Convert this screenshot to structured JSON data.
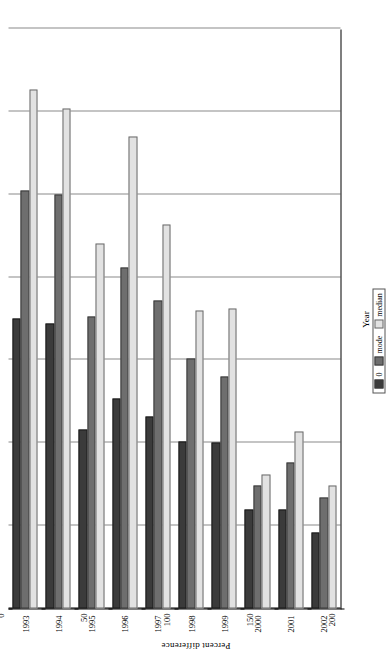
{
  "chart_data": {
    "type": "bar",
    "orientation": "horizontal-rotated",
    "title": "",
    "xlabel": "Year",
    "ylabel": "Percent difference",
    "categories": [
      "1993",
      "1994",
      "1995",
      "1996",
      "1997",
      "1998",
      "1999",
      "2000",
      "2001",
      "2002"
    ],
    "ylim": [
      0,
      350
    ],
    "yticks": [
      0,
      50,
      100,
      150,
      200,
      250,
      300,
      350
    ],
    "ytick_labels": [
      "0",
      "50",
      "100",
      "150",
      "200",
      "250",
      "300",
      "350"
    ],
    "grid": true,
    "legend_position": "bottom-right",
    "series": [
      {
        "name": "0",
        "color": "#3b3b3b",
        "values": [
          175,
          172,
          108,
          127,
          116,
          101,
          100,
          60,
          60,
          46
        ]
      },
      {
        "name": "mode",
        "color": "#6e6e6e",
        "values": [
          252,
          250,
          176,
          206,
          186,
          151,
          140,
          74,
          88,
          67
        ]
      },
      {
        "name": "median",
        "color": "#e2e2e2",
        "values": [
          313,
          302,
          220,
          285,
          232,
          180,
          181,
          81,
          107,
          74
        ]
      }
    ]
  },
  "legend": {
    "items": [
      {
        "label": "0"
      },
      {
        "label": "mode"
      },
      {
        "label": "median"
      }
    ]
  }
}
